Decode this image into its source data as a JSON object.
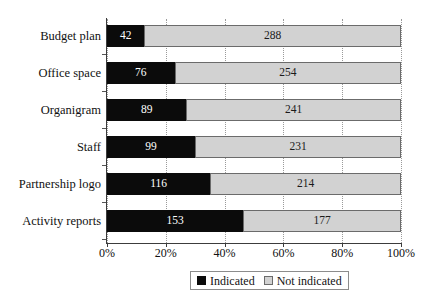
{
  "chart_data": {
    "type": "bar",
    "subtype": "stacked-horizontal-100percent",
    "title": "",
    "xlabel": "",
    "ylabel": "",
    "categories": [
      "Budget plan",
      "Office space",
      "Organigram",
      "Staff",
      "Partnership logo",
      "Activity reports"
    ],
    "series": [
      {
        "name": "Indicated",
        "color": "#0b0b0b",
        "values": [
          42,
          76,
          89,
          99,
          116,
          153
        ]
      },
      {
        "name": "Not indicated",
        "color": "#d2d2d2",
        "values": [
          288,
          254,
          241,
          231,
          214,
          177
        ]
      }
    ],
    "totals": [
      330,
      330,
      330,
      330,
      330,
      330
    ],
    "xlim": [
      0,
      100
    ],
    "xticks": [
      0,
      20,
      40,
      60,
      80,
      100
    ],
    "xtick_labels": [
      "0%",
      "20%",
      "40%",
      "60%",
      "80%",
      "100%"
    ],
    "grid": true,
    "grid_axis": "x",
    "legend_position": "bottom",
    "data_labels": true
  },
  "legend": {
    "items": [
      {
        "label": "Indicated",
        "swatch": "indicated"
      },
      {
        "label": "Not indicated",
        "swatch": "not-indicated"
      }
    ]
  }
}
